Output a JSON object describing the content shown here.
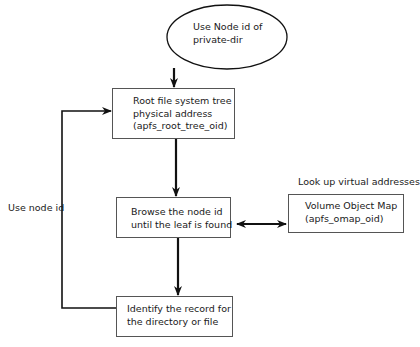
{
  "diagram": {
    "start": {
      "lines": [
        "Use Node id of",
        "private-dir"
      ]
    },
    "root_tree": {
      "lines": [
        "Root file system  tree",
        "physical address",
        "(apfs_root_tree_oid)"
      ]
    },
    "browse": {
      "lines": [
        "Browse the node id",
        "until the leaf is found"
      ]
    },
    "omap": {
      "lines": [
        "Volume Object Map",
        "(apfs_omap_oid)"
      ]
    },
    "identify": {
      "lines": [
        "Identify the record for",
        "the directory or file"
      ]
    },
    "labels": {
      "lookup": "Look up virtual addresses",
      "use_node_id": "Use node id"
    },
    "colors": {
      "stroke": "#111111",
      "box_border": "#555555",
      "background": "#ffffff"
    }
  }
}
